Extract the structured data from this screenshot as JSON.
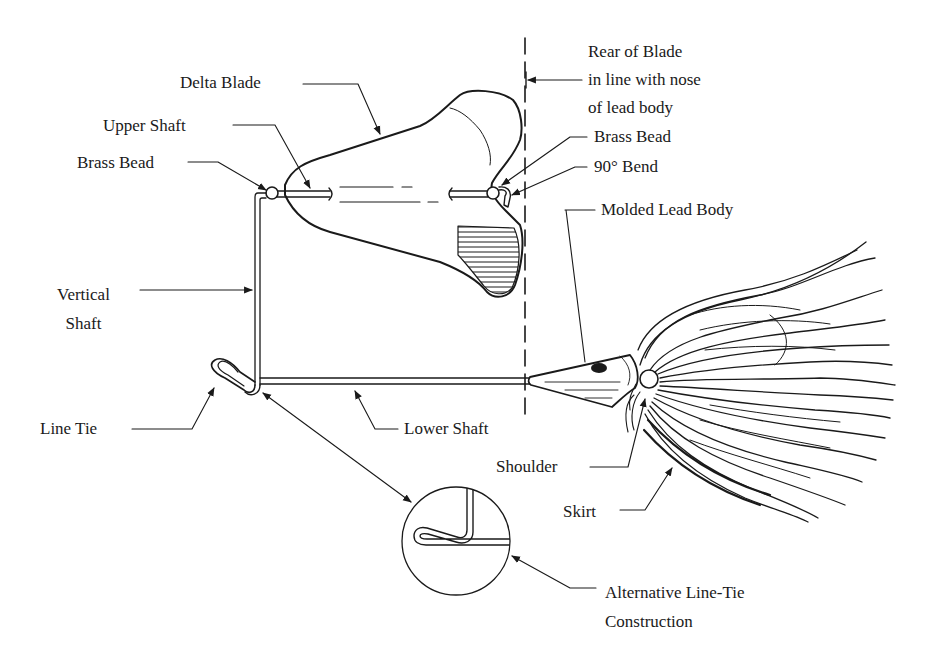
{
  "diagram": {
    "line_color": "#1a1a1a",
    "background": "#ffffff",
    "labels": {
      "delta_blade": "Delta Blade",
      "upper_shaft": "Upper Shaft",
      "brass_bead_left": "Brass Bead",
      "rear_of_blade": [
        "Rear of Blade",
        "in line with nose",
        "of lead body"
      ],
      "brass_bead_right": "Brass Bead",
      "bend_90": "90° Bend",
      "molded_lead_body": "Molded Lead Body",
      "vertical_shaft": [
        "Vertical",
        "Shaft"
      ],
      "line_tie": "Line Tie",
      "lower_shaft": "Lower Shaft",
      "shoulder": "Shoulder",
      "skirt": "Skirt",
      "alt_line_tie": [
        "Alternative Line-Tie",
        "Construction"
      ]
    },
    "parts": [
      "delta-blade",
      "upper-shaft",
      "brass-bead",
      "90-degree-bend",
      "vertical-shaft",
      "line-tie",
      "lower-shaft",
      "molded-lead-body",
      "shoulder",
      "skirt",
      "alternative-line-tie-inset"
    ]
  }
}
